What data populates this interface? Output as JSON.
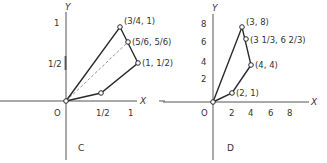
{
  "panels": [
    {
      "id": "C",
      "label": "C",
      "axes": {
        "x_label": "X",
        "y_label": "Y",
        "origin_label": "O"
      },
      "x_ticks": [
        "1/2",
        "1"
      ],
      "y_ticks": [
        "1",
        "1/2"
      ],
      "points": [
        {
          "label": "(3/4, 1)"
        },
        {
          "label": "(5/6, 5/6)"
        },
        {
          "label": "(1, 1/2)"
        }
      ],
      "polygon_vertices": [
        "(0,0)",
        "(3/4,1)",
        "(1,1/2)",
        "(1/2,1/6)"
      ],
      "dashed_line": "(0,0) to (5/6,5/6)"
    },
    {
      "id": "D",
      "label": "D",
      "axes": {
        "x_label": "X",
        "y_label": "Y",
        "origin_label": "O"
      },
      "x_ticks": [
        "2",
        "4",
        "6",
        "8"
      ],
      "y_ticks": [
        "8",
        "6",
        "4",
        "2"
      ],
      "points": [
        {
          "label": "(3, 8)"
        },
        {
          "label": "(3 1/3, 6 2/3)"
        },
        {
          "label": "(4, 4)"
        },
        {
          "label": "(2, 1)"
        }
      ],
      "polygon_vertices": [
        "(0,0)",
        "(3,8)",
        "(4,4)",
        "(2,1)"
      ]
    }
  ]
}
